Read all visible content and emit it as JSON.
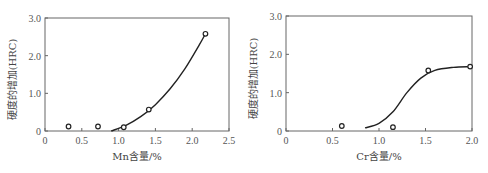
{
  "chart_data": [
    {
      "type": "scatter",
      "title": "",
      "xlabel": "Mn含量/%",
      "ylabel": "硬度的增加(HRC)",
      "xlim": [
        0,
        2.5
      ],
      "ylim": [
        0,
        3.0
      ],
      "xticks": [
        "0",
        "0.5",
        "1.0",
        "1.5",
        "2.0",
        "2.5"
      ],
      "yticks": [
        "0",
        "1.0",
        "2.0",
        "3.0"
      ],
      "grid": false,
      "series": [
        {
          "name": "measured",
          "x": [
            0.32,
            0.72,
            1.07,
            1.41,
            2.18
          ],
          "y": [
            0.12,
            0.12,
            0.1,
            0.57,
            2.58
          ]
        },
        {
          "name": "fit curve",
          "x": [
            0.9,
            1.1,
            1.3,
            1.5,
            1.7,
            1.9,
            2.1,
            2.18
          ],
          "y": [
            0.0,
            0.15,
            0.38,
            0.7,
            1.12,
            1.65,
            2.3,
            2.58
          ]
        }
      ]
    },
    {
      "type": "scatter",
      "title": "",
      "xlabel": "Cr含量/%",
      "ylabel": "硬度的增加(HRC)",
      "xlim": [
        0,
        2.0
      ],
      "ylim": [
        0,
        3.0
      ],
      "xticks": [
        "0",
        "0.5",
        "1.0",
        "1.5",
        "2.0"
      ],
      "yticks": [
        "0",
        "1.0",
        "2.0",
        "3.0"
      ],
      "grid": false,
      "series": [
        {
          "name": "measured",
          "x": [
            0.6,
            1.15,
            1.53,
            1.98
          ],
          "y": [
            0.13,
            0.1,
            1.58,
            1.68
          ]
        },
        {
          "name": "fit curve",
          "x": [
            0.85,
            1.0,
            1.15,
            1.3,
            1.45,
            1.6,
            1.8,
            1.98
          ],
          "y": [
            0.08,
            0.2,
            0.5,
            1.0,
            1.38,
            1.58,
            1.66,
            1.68
          ]
        }
      ]
    }
  ]
}
